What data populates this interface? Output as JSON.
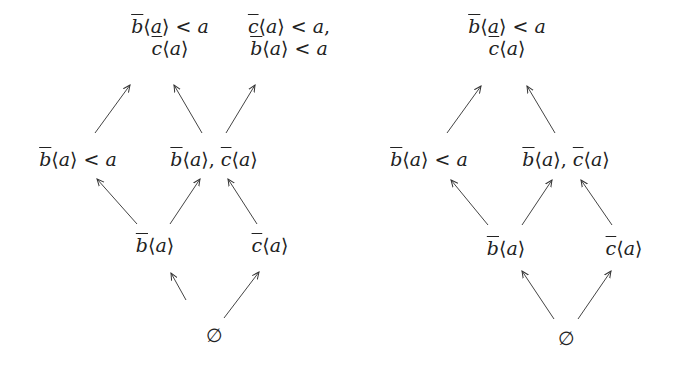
{
  "diagrams": [
    {
      "id": "left",
      "nodes": [
        {
          "key": "top1",
          "lines": [
            "b̄⟨a⟩ < a",
            "c̄⟨a⟩"
          ],
          "x": 170,
          "y": 37
        },
        {
          "key": "top2",
          "lines": [
            "c̄⟨a⟩ < a,",
            "b̄⟨a⟩ < a"
          ],
          "x": 289,
          "y": 37
        },
        {
          "key": "mid1",
          "lines": [
            "b̄⟨a⟩ < a"
          ],
          "x": 78,
          "y": 159
        },
        {
          "key": "mid2",
          "lines": [
            "b̄⟨a⟩, c̄⟨a⟩"
          ],
          "x": 214,
          "y": 159
        },
        {
          "key": "low1",
          "lines": [
            "b̄⟨a⟩"
          ],
          "x": 155,
          "y": 245
        },
        {
          "key": "low2",
          "lines": [
            "c̄⟨a⟩"
          ],
          "x": 270,
          "y": 245
        },
        {
          "key": "bottom",
          "lines": [
            "∅"
          ],
          "x": 214,
          "y": 335
        }
      ],
      "edges": [
        {
          "from": [
            186,
            300
          ],
          "to": [
            171,
            273
          ]
        },
        {
          "from": [
            224,
            318
          ],
          "to": [
            259,
            272
          ]
        },
        {
          "from": [
            137,
            224
          ],
          "to": [
            97,
            179
          ]
        },
        {
          "from": [
            170,
            224
          ],
          "to": [
            200,
            179
          ]
        },
        {
          "from": [
            257,
            224
          ],
          "to": [
            228,
            179
          ]
        },
        {
          "from": [
            95,
            133
          ],
          "to": [
            130,
            85
          ]
        },
        {
          "from": [
            202,
            133
          ],
          "to": [
            174,
            85
          ]
        },
        {
          "from": [
            226,
            133
          ],
          "to": [
            255,
            85
          ]
        }
      ]
    },
    {
      "id": "right",
      "nodes": [
        {
          "key": "top",
          "lines": [
            "b̄⟨a⟩ < a",
            "c̄⟨a⟩"
          ],
          "x": 507,
          "y": 37
        },
        {
          "key": "mid1",
          "lines": [
            "b̄⟨a⟩ < a"
          ],
          "x": 429,
          "y": 159
        },
        {
          "key": "mid2",
          "lines": [
            "b̄⟨a⟩, c̄⟨a⟩"
          ],
          "x": 566,
          "y": 159
        },
        {
          "key": "low1",
          "lines": [
            "b̄⟨a⟩"
          ],
          "x": 506,
          "y": 248
        },
        {
          "key": "low2",
          "lines": [
            "c̄⟨a⟩"
          ],
          "x": 624,
          "y": 248
        },
        {
          "key": "bottom",
          "lines": [
            "∅"
          ],
          "x": 566,
          "y": 338
        }
      ],
      "edges": [
        {
          "from": [
            554,
            319
          ],
          "to": [
            522,
            271
          ]
        },
        {
          "from": [
            578,
            319
          ],
          "to": [
            611,
            271
          ]
        },
        {
          "from": [
            488,
            225
          ],
          "to": [
            451,
            180
          ]
        },
        {
          "from": [
            522,
            225
          ],
          "to": [
            552,
            180
          ]
        },
        {
          "from": [
            612,
            225
          ],
          "to": [
            581,
            180
          ]
        },
        {
          "from": [
            447,
            133
          ],
          "to": [
            481,
            86
          ]
        },
        {
          "from": [
            555,
            133
          ],
          "to": [
            527,
            86
          ]
        }
      ]
    }
  ]
}
